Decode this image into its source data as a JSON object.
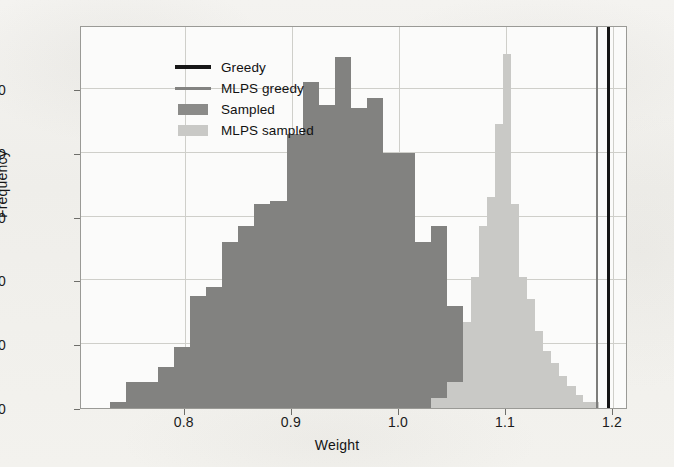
{
  "chart_data": {
    "type": "bar",
    "title": "",
    "xlabel": "Weight",
    "ylabel": "Frequency",
    "xlim": [
      0.703,
      1.214
    ],
    "ylim": [
      0,
      120
    ],
    "grid": true,
    "xticks": [
      0.8,
      0.9,
      1.0,
      1.1,
      1.2
    ],
    "xtick_labels": [
      "0.8",
      "0.9",
      "1.0",
      "1.1",
      "1.2"
    ],
    "yticks": [
      0,
      20,
      40,
      60,
      80,
      100
    ],
    "ytick_labels": [
      "0",
      "20",
      "40",
      "60",
      "80",
      "100"
    ],
    "legend_position": "upper left",
    "bin_width": 0.015,
    "series": [
      {
        "name": "Sampled",
        "kind": "histogram",
        "color": "#828280",
        "bins_left": [
          0.73,
          0.745,
          0.76,
          0.775,
          0.79,
          0.805,
          0.82,
          0.835,
          0.85,
          0.865,
          0.88,
          0.895,
          0.91,
          0.925,
          0.94,
          0.955,
          0.97,
          0.985,
          1.0,
          1.015,
          1.03,
          1.045,
          1.06,
          1.075,
          1.09,
          1.105,
          1.12
        ],
        "values": [
          2,
          8,
          8,
          13,
          19,
          35,
          38,
          52,
          57,
          64,
          65,
          86,
          102,
          95,
          110,
          94,
          97,
          80,
          80,
          52,
          57,
          32,
          24,
          15,
          9,
          6,
          1
        ]
      },
      {
        "name": "MLPS sampled",
        "kind": "histogram",
        "color": "#c9c9c6",
        "bins_left": [
          1.03,
          1.045,
          1.06,
          1.067,
          1.075,
          1.082,
          1.09,
          1.097,
          1.105,
          1.112,
          1.12,
          1.127,
          1.135,
          1.142,
          1.15,
          1.157,
          1.165,
          1.172
        ],
        "values": [
          3,
          8,
          27,
          41,
          57,
          66,
          89,
          111,
          64,
          41,
          34,
          24,
          18,
          14,
          10,
          7,
          4,
          2
        ]
      }
    ],
    "vlines": [
      {
        "name": "MLPS greedy",
        "x": 1.185,
        "color": "#7d7d7b"
      },
      {
        "name": "Greedy",
        "x": 1.196,
        "color": "#151515"
      }
    ],
    "legend": [
      {
        "label": "Greedy",
        "marker": "line",
        "color": "#171717"
      },
      {
        "label": "MLPS greedy",
        "marker": "line",
        "color": "#838381"
      },
      {
        "label": "Sampled",
        "marker": "patch",
        "color": "#8b8b89"
      },
      {
        "label": "MLPS sampled",
        "marker": "patch",
        "color": "#c9c9c6"
      }
    ]
  }
}
